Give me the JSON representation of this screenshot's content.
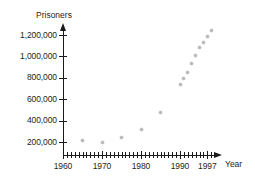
{
  "chart_data": {
    "type": "scatter",
    "title": "",
    "xlabel": "Year",
    "ylabel": "Prisoners",
    "xlim": [
      1960,
      1999
    ],
    "ylim": [
      0,
      1260000
    ],
    "grid": false,
    "legend": null,
    "x_tick_labels": [
      "1960",
      "1970",
      "1980",
      "1990",
      "1997"
    ],
    "x_tick_values": [
      1960,
      1970,
      1980,
      1990,
      1997
    ],
    "x_minor_tick_step": 1,
    "y_tick_labels": [
      "200,000",
      "400,000",
      "600,000",
      "800,000",
      "1,000,000",
      "1,200,000"
    ],
    "y_tick_values": [
      200000,
      400000,
      600000,
      800000,
      1000000,
      1200000
    ],
    "x": [
      1965,
      1970,
      1975,
      1980,
      1985,
      1990,
      1991,
      1992,
      1993,
      1994,
      1995,
      1996,
      1997,
      1998
    ],
    "values": [
      210000,
      196000,
      240000,
      315000,
      480000,
      740000,
      790000,
      850000,
      930000,
      1010000,
      1080000,
      1130000,
      1190000,
      1240000
    ],
    "points": [
      {
        "x": 1965,
        "y": 210000
      },
      {
        "x": 1970,
        "y": 196000
      },
      {
        "x": 1975,
        "y": 240000
      },
      {
        "x": 1980,
        "y": 315000
      },
      {
        "x": 1985,
        "y": 480000
      },
      {
        "x": 1990,
        "y": 740000
      },
      {
        "x": 1991,
        "y": 790000
      },
      {
        "x": 1992,
        "y": 850000
      },
      {
        "x": 1993,
        "y": 930000
      },
      {
        "x": 1994,
        "y": 1010000
      },
      {
        "x": 1995,
        "y": 1080000
      },
      {
        "x": 1996,
        "y": 1130000
      },
      {
        "x": 1997,
        "y": 1190000
      },
      {
        "x": 1998,
        "y": 1240000
      }
    ],
    "marker_color": "#b9b9bd",
    "axis_color": "#1a1a1a",
    "text_color": "#231f20"
  }
}
